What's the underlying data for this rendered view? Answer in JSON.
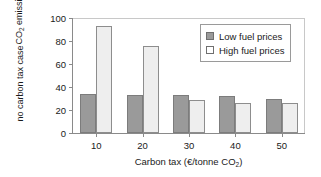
{
  "chart_data": {
    "type": "bar",
    "title": "",
    "xlabel": "Carbon tax (€/tonne CO2)",
    "ylabel": "CO2 emissions as % of no carbon tax case",
    "categories": [
      "10",
      "20",
      "30",
      "40",
      "50"
    ],
    "series": [
      {
        "name": "Low fuel prices",
        "color": "#9a9a9a",
        "values": [
          34,
          33,
          33,
          32,
          30
        ]
      },
      {
        "name": "High fuel prices",
        "color": "#eeeeee",
        "values": [
          93,
          76,
          29,
          26,
          26
        ]
      }
    ],
    "ylim": [
      0,
      100
    ],
    "yticks": [
      0,
      20,
      40,
      60,
      80,
      100
    ],
    "ytick_labels": [
      "0",
      "20",
      "40",
      "60",
      "80",
      "100"
    ],
    "grid": false,
    "legend_position": "top-right"
  },
  "axes": {
    "ylabel_line1_pre": "CO",
    "ylabel_line1_sub": "2",
    "ylabel_line1_post": " emissions as % of",
    "ylabel_line2": "no carbon tax case",
    "xlabel_pre": "Carbon tax (€/tonne CO",
    "xlabel_sub": "2",
    "xlabel_post": ")"
  },
  "legend": {
    "items": [
      {
        "label": "Low fuel prices"
      },
      {
        "label": "High fuel prices"
      }
    ]
  }
}
